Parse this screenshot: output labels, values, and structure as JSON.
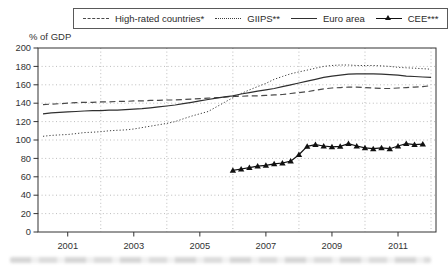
{
  "legend": {
    "items": [
      {
        "id": "high-rated",
        "label": "High-rated countries*",
        "line_style": "dashed"
      },
      {
        "id": "giips",
        "label": "GIIPS**",
        "line_style": "dotted"
      },
      {
        "id": "euro-area",
        "label": "Euro area",
        "line_style": "solid"
      },
      {
        "id": "cee",
        "label": "CEE***",
        "line_style": "solid-with-triangle-markers"
      }
    ]
  },
  "chart_data": {
    "type": "line",
    "title": "",
    "ylabel": "% of GDP",
    "xlabel": "",
    "ylim": [
      0,
      200
    ],
    "yticks": [
      0,
      20,
      40,
      60,
      80,
      100,
      120,
      140,
      160,
      180,
      200
    ],
    "xlim": [
      2000.1,
      2012.15
    ],
    "xticks": [
      2001,
      2003,
      2005,
      2007,
      2009,
      2011
    ],
    "x_gridlines": [
      2002,
      2004,
      2006,
      2008,
      2010,
      2012
    ],
    "grid": "dotted",
    "legend_position": "top",
    "frequency": "quarterly",
    "colors": {
      "grid": "#bcbcbc",
      "axis": "#333333"
    },
    "series": [
      {
        "id": "high-rated",
        "name": "High-rated countries*",
        "line_style": "dashed",
        "marker": "none",
        "color": "#4a4a4a",
        "x_start": 2000.25,
        "x_step": 0.25,
        "values": [
          138.5,
          139,
          139.5,
          140,
          140.5,
          141,
          141,
          141.5,
          141.5,
          142,
          142,
          142.5,
          142.5,
          143,
          143,
          143.5,
          143.5,
          144,
          144.5,
          145,
          145.5,
          146,
          146.5,
          147.5,
          147.5,
          148,
          148,
          148.5,
          149,
          149.5,
          150.5,
          151.5,
          152.5,
          154,
          155.5,
          156.5,
          157,
          157.5,
          157.5,
          157,
          156.5,
          156,
          156,
          156.5,
          157,
          157.5,
          158,
          159
        ]
      },
      {
        "id": "giips",
        "name": "GIIPS**",
        "line_style": "dotted",
        "marker": "none",
        "color": "#3d3d3d",
        "x_start": 2000.25,
        "x_step": 0.25,
        "values": [
          104,
          105,
          105.5,
          106,
          107,
          108,
          108.5,
          109,
          110,
          110.5,
          111,
          112,
          113.5,
          115,
          116.5,
          118,
          120,
          123,
          126,
          128.5,
          131,
          136,
          141,
          146,
          150.5,
          154.5,
          158,
          161.5,
          166,
          169,
          172,
          174,
          176,
          178,
          180,
          181,
          181.5,
          181.5,
          181,
          181,
          181,
          180.5,
          180,
          179,
          178.5,
          178,
          177.5,
          177
        ]
      },
      {
        "id": "euro-area",
        "name": "Euro area",
        "line_style": "solid",
        "marker": "none",
        "color": "#2f2f2f",
        "x_start": 2000.25,
        "x_step": 0.25,
        "values": [
          128.5,
          129.5,
          130,
          130.5,
          131,
          131.5,
          132,
          132,
          132.5,
          132.5,
          133,
          133.5,
          134,
          135,
          136,
          137,
          138,
          139.5,
          141,
          142.5,
          144,
          145.5,
          147,
          148,
          150,
          151.5,
          153,
          154.5,
          156,
          158,
          160,
          162,
          164,
          166,
          168,
          169.5,
          170.5,
          171.5,
          172,
          172,
          172,
          171.5,
          171,
          170.5,
          169.5,
          169,
          168.5,
          168
        ]
      },
      {
        "id": "cee",
        "name": "CEE***",
        "line_style": "solid",
        "marker": "triangle",
        "color": "#111111",
        "x_start": 2006.0,
        "x_step": 0.25,
        "values": [
          67,
          68.5,
          70,
          71.5,
          72.5,
          74,
          75,
          77,
          84,
          93,
          95,
          93.5,
          92.5,
          93,
          96,
          93.5,
          91.5,
          90.5,
          91.5,
          90.5,
          93.5,
          96,
          95,
          95.5
        ]
      }
    ]
  }
}
